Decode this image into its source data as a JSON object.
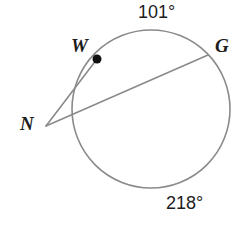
{
  "figure": {
    "background_color": "#ffffff",
    "stroke_color": "#8a8a8a",
    "text_color": "#1c1c1c",
    "point_fill_color": "#111111",
    "circle": {
      "center_x": 151,
      "center_y": 109,
      "radius": 79,
      "stroke_width": 1.6
    },
    "points": {
      "W": {
        "label": "W",
        "x": 97,
        "y": 59,
        "marker": "filled-dot",
        "marker_radius": 4.5
      },
      "G": {
        "label": "G",
        "x": 208,
        "y": 55,
        "marker": "none"
      },
      "N": {
        "label": "N",
        "x": 46,
        "y": 126,
        "marker": "none"
      }
    },
    "segments": [
      {
        "name": "secant-N-G",
        "from": "N",
        "to": "G",
        "x1": 46,
        "y1": 126,
        "x2": 208,
        "y2": 55
      },
      {
        "name": "tangent-N-W",
        "from": "N",
        "to": "W",
        "x1": 46,
        "y1": 126,
        "x2": 97,
        "y2": 59
      }
    ],
    "arc_labels": {
      "top": "101°",
      "bottom": "218°"
    },
    "arc_values": {
      "top_degrees": 101,
      "bottom_degrees": 218
    }
  }
}
